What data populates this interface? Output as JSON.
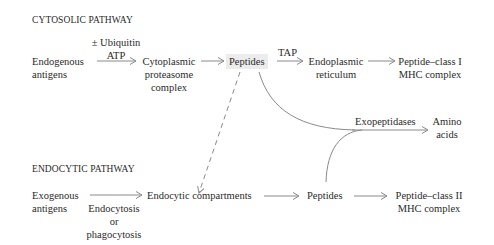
{
  "cytosolic": {
    "header": "CYTOSOLIC PATHWAY",
    "source": [
      "Endogenous",
      "antigens"
    ],
    "arrow1_label": [
      "± Ubiquitin",
      "ATP"
    ],
    "proteasome": [
      "Cytoplasmic",
      "proteasome",
      "complex"
    ],
    "peptides": "Peptides",
    "arrow3_label": "TAP",
    "er": [
      "Endoplasmic",
      "reticulum"
    ],
    "product": [
      "Peptide–class I",
      "MHC complex"
    ]
  },
  "exopeptidase": {
    "label": "Exopeptidases",
    "product": [
      "Amino",
      "acids"
    ]
  },
  "endocytic": {
    "header": "ENDOCYTIC PATHWAY",
    "source": [
      "Exogenous",
      "antigens"
    ],
    "arrow1_label": [
      "Endocytosis",
      "or",
      "phagocytosis"
    ],
    "compartments": "Endocytic compartments",
    "peptides": "Peptides",
    "product": [
      "Peptide–class II",
      "MHC complex"
    ]
  },
  "colors": {
    "text": "#2a2a2a",
    "arrow": "#8a8a8a",
    "highlight": "#ececec"
  }
}
